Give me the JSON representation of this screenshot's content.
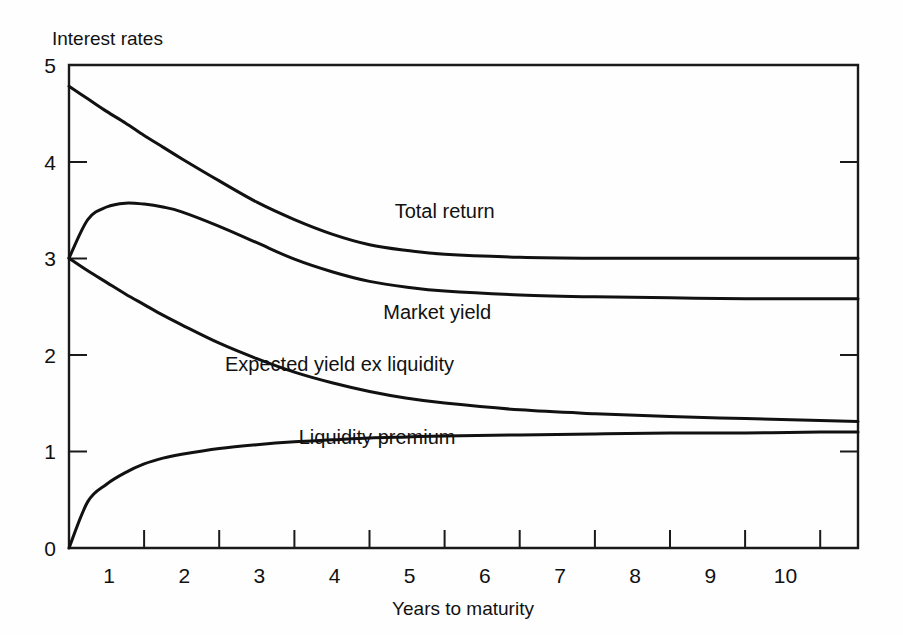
{
  "chart_data": {
    "type": "line",
    "title": "",
    "ylabel": "Interest rates",
    "xlabel": "Years to maturity",
    "xlim": [
      0,
      10.5
    ],
    "ylim": [
      0,
      5
    ],
    "grid": false,
    "legend": "inline-curve-labels",
    "x_ticks": [
      1,
      2,
      3,
      4,
      5,
      6,
      7,
      8,
      9,
      10
    ],
    "x_tick_labels": [
      "1",
      "2",
      "3",
      "4",
      "5",
      "6",
      "7",
      "8",
      "9",
      "10"
    ],
    "y_ticks": [
      0,
      1,
      2,
      3,
      4,
      5
    ],
    "y_tick_labels": [
      "0",
      "1",
      "2",
      "3",
      "4",
      "5"
    ],
    "x": [
      0,
      0.25,
      0.5,
      0.75,
      1,
      1.25,
      1.5,
      2,
      2.5,
      3,
      3.5,
      4,
      4.5,
      5,
      6,
      7,
      8,
      9,
      10,
      10.5
    ],
    "series": [
      {
        "name": "Total return",
        "label": "Total return",
        "label_x": 5.0,
        "label_y": 3.42,
        "values": [
          4.78,
          4.65,
          4.52,
          4.4,
          4.27,
          4.15,
          4.03,
          3.8,
          3.58,
          3.4,
          3.25,
          3.14,
          3.08,
          3.04,
          3.01,
          3.0,
          3.0,
          3.0,
          3.0,
          3.0
        ]
      },
      {
        "name": "Market yield",
        "label": "Market yield",
        "label_x": 4.9,
        "label_y": 2.37,
        "values": [
          3.0,
          3.4,
          3.53,
          3.57,
          3.56,
          3.53,
          3.48,
          3.33,
          3.16,
          2.99,
          2.86,
          2.76,
          2.7,
          2.66,
          2.62,
          2.6,
          2.59,
          2.58,
          2.58,
          2.58
        ]
      },
      {
        "name": "Expected yield ex liquidity",
        "label": "Expected yield ex liquidity",
        "label_x": 3.6,
        "label_y": 1.83,
        "values": [
          3.0,
          2.87,
          2.75,
          2.63,
          2.52,
          2.41,
          2.31,
          2.12,
          1.96,
          1.82,
          1.71,
          1.62,
          1.55,
          1.5,
          1.43,
          1.39,
          1.36,
          1.34,
          1.32,
          1.31
        ]
      },
      {
        "name": "Liquidity premium",
        "label": "Liquidity premium",
        "label_x": 4.1,
        "label_y": 1.08,
        "values": [
          0.0,
          0.48,
          0.66,
          0.78,
          0.87,
          0.93,
          0.97,
          1.03,
          1.07,
          1.1,
          1.12,
          1.14,
          1.15,
          1.16,
          1.17,
          1.18,
          1.19,
          1.19,
          1.2,
          1.2
        ]
      }
    ]
  },
  "figure": {
    "background_color": "#fefefe",
    "line_color": "#111111",
    "axis_color": "#1a1a1a"
  }
}
